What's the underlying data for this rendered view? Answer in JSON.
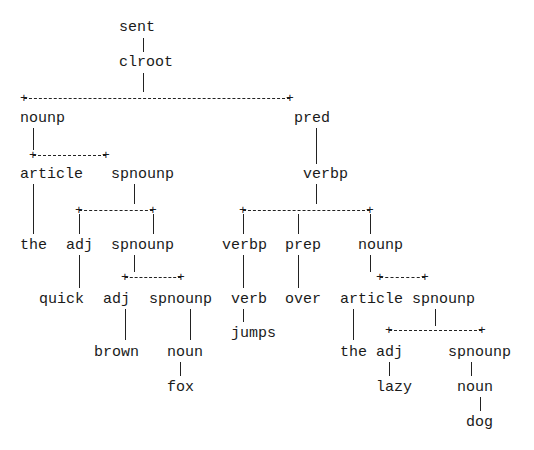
{
  "diagram": {
    "type": "parse-tree",
    "nodes": [
      {
        "id": "sent",
        "label": "sent",
        "x": 119,
        "y": 20
      },
      {
        "id": "clroot",
        "label": "clroot",
        "x": 119,
        "y": 55
      },
      {
        "id": "nounp1",
        "label": "nounp",
        "x": 20,
        "y": 111
      },
      {
        "id": "pred",
        "label": "pred",
        "x": 294,
        "y": 111
      },
      {
        "id": "article1",
        "label": "article",
        "x": 20,
        "y": 167
      },
      {
        "id": "spnounp1",
        "label": "spnounp",
        "x": 111,
        "y": 167
      },
      {
        "id": "verbp1",
        "label": "verbp",
        "x": 303,
        "y": 167
      },
      {
        "id": "the1",
        "label": "the",
        "x": 20,
        "y": 238
      },
      {
        "id": "adj1",
        "label": "adj",
        "x": 66,
        "y": 238
      },
      {
        "id": "spnounp2",
        "label": "spnounp",
        "x": 111,
        "y": 238
      },
      {
        "id": "verbp2",
        "label": "verbp",
        "x": 222,
        "y": 238
      },
      {
        "id": "prep",
        "label": "prep",
        "x": 285,
        "y": 238
      },
      {
        "id": "nounp2",
        "label": "nounp",
        "x": 358,
        "y": 238
      },
      {
        "id": "quick",
        "label": "quick",
        "x": 39,
        "y": 292
      },
      {
        "id": "adj2",
        "label": "adj",
        "x": 103,
        "y": 292
      },
      {
        "id": "spnounp3",
        "label": "spnounp",
        "x": 149,
        "y": 292
      },
      {
        "id": "verb",
        "label": "verb",
        "x": 231,
        "y": 292
      },
      {
        "id": "over",
        "label": "over",
        "x": 285,
        "y": 292
      },
      {
        "id": "article2",
        "label": "article",
        "x": 340,
        "y": 292
      },
      {
        "id": "spnounp4",
        "label": "spnounp",
        "x": 412,
        "y": 292
      },
      {
        "id": "jumps",
        "label": "jumps",
        "x": 231,
        "y": 326
      },
      {
        "id": "brown",
        "label": "brown",
        "x": 94,
        "y": 345
      },
      {
        "id": "noun1",
        "label": "noun",
        "x": 167,
        "y": 345
      },
      {
        "id": "the2",
        "label": "the",
        "x": 340,
        "y": 345
      },
      {
        "id": "adj3",
        "label": "adj",
        "x": 376,
        "y": 345
      },
      {
        "id": "spnounp5",
        "label": "spnounp",
        "x": 448,
        "y": 345
      },
      {
        "id": "fox",
        "label": "fox",
        "x": 167,
        "y": 380
      },
      {
        "id": "lazy",
        "label": "lazy",
        "x": 376,
        "y": 380
      },
      {
        "id": "noun2",
        "label": "noun",
        "x": 457,
        "y": 380
      },
      {
        "id": "dog",
        "label": "dog",
        "x": 466,
        "y": 415
      }
    ],
    "connectors": {
      "horizontal": [
        {
          "x1": 24,
          "x2": 290,
          "y": 98
        },
        {
          "x1": 33,
          "x2": 106,
          "y": 155
        },
        {
          "x1": 79,
          "x2": 153,
          "y": 210
        },
        {
          "x1": 243,
          "x2": 370,
          "y": 210
        },
        {
          "x1": 125,
          "x2": 181,
          "y": 277
        },
        {
          "x1": 380,
          "x2": 425,
          "y": 277
        },
        {
          "x1": 389,
          "x2": 482,
          "y": 330
        }
      ],
      "vertical": [
        {
          "x": 143,
          "y1": 38,
          "y2": 52
        },
        {
          "x": 143,
          "y1": 73,
          "y2": 92
        },
        {
          "x": 33,
          "y1": 128,
          "y2": 150
        },
        {
          "x": 316,
          "y1": 128,
          "y2": 164
        },
        {
          "x": 33,
          "y1": 184,
          "y2": 234
        },
        {
          "x": 134,
          "y1": 184,
          "y2": 204
        },
        {
          "x": 79,
          "y1": 214,
          "y2": 234
        },
        {
          "x": 153,
          "y1": 214,
          "y2": 234
        },
        {
          "x": 316,
          "y1": 184,
          "y2": 204
        },
        {
          "x": 243,
          "y1": 214,
          "y2": 234
        },
        {
          "x": 298,
          "y1": 214,
          "y2": 234
        },
        {
          "x": 370,
          "y1": 214,
          "y2": 234
        },
        {
          "x": 79,
          "y1": 255,
          "y2": 288
        },
        {
          "x": 134,
          "y1": 255,
          "y2": 272
        },
        {
          "x": 243,
          "y1": 255,
          "y2": 288
        },
        {
          "x": 298,
          "y1": 255,
          "y2": 288
        },
        {
          "x": 370,
          "y1": 255,
          "y2": 272
        },
        {
          "x": 125,
          "y1": 309,
          "y2": 340
        },
        {
          "x": 190,
          "y1": 309,
          "y2": 340
        },
        {
          "x": 243,
          "y1": 309,
          "y2": 322
        },
        {
          "x": 353,
          "y1": 309,
          "y2": 340
        },
        {
          "x": 435,
          "y1": 309,
          "y2": 326
        },
        {
          "x": 389,
          "y1": 362,
          "y2": 376
        },
        {
          "x": 180,
          "y1": 362,
          "y2": 376
        },
        {
          "x": 471,
          "y1": 362,
          "y2": 376
        },
        {
          "x": 480,
          "y1": 397,
          "y2": 411
        }
      ]
    }
  }
}
